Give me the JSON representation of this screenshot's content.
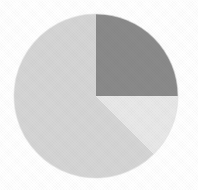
{
  "chart_data": {
    "type": "pie",
    "title": "",
    "subtitle": "",
    "xlabel": "",
    "ylabel": "",
    "legend": "none",
    "grid": false,
    "labels_shown": false,
    "start_angle_deg": 90,
    "direction": "clockwise",
    "categories": [
      "Slice 1",
      "Slice 2",
      "Slice 3"
    ],
    "values": [
      25,
      12.5,
      62.5
    ],
    "percentages": [
      "25%",
      "12.5%",
      "62.5%"
    ],
    "slices": [
      {
        "name": "Slice 1",
        "value": 25,
        "percent": 25,
        "sweep_deg": 90,
        "start_deg": 0,
        "end_deg": 90,
        "color": "#8a8a8a",
        "position": "top-right"
      },
      {
        "name": "Slice 2",
        "value": 12.5,
        "percent": 12.5,
        "sweep_deg": 45,
        "start_deg": 90,
        "end_deg": 135,
        "color": "#e8e8e8",
        "position": "right-lower"
      },
      {
        "name": "Slice 3",
        "value": 62.5,
        "percent": 62.5,
        "sweep_deg": 225,
        "start_deg": 135,
        "end_deg": 360,
        "color": "#d5d5d5",
        "position": "left-and-bottom"
      }
    ]
  },
  "geometry": {
    "center_x": 96,
    "center_y": 96,
    "radius": 82,
    "canvas_width": 198,
    "canvas_height": 190
  },
  "colors": {
    "background": "#ffffff",
    "slice_dark": "#8a8a8a",
    "slice_light": "#e8e8e8",
    "slice_mid": "#d5d5d5",
    "outline": "#b9b9b9"
  }
}
